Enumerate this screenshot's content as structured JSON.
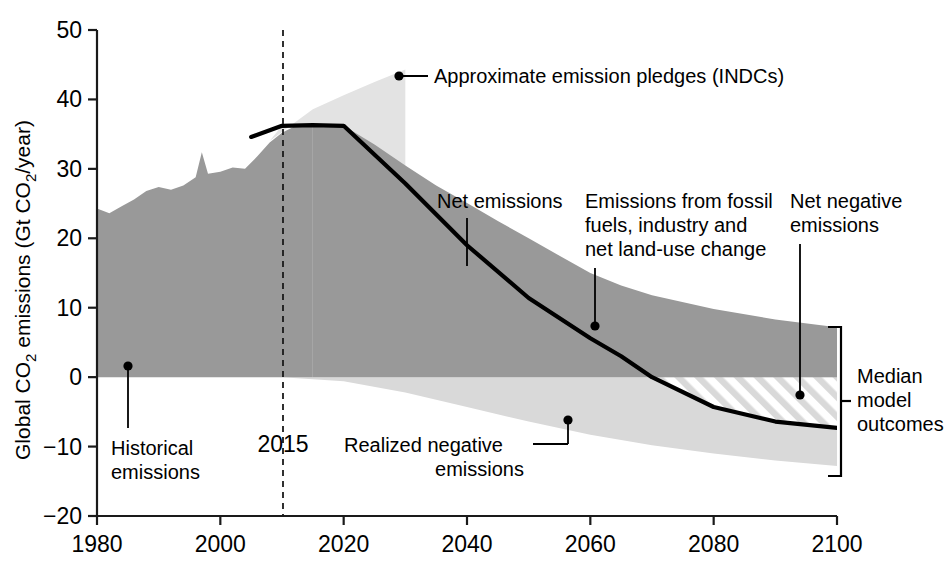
{
  "chart_data": {
    "type": "area",
    "title": "",
    "xlabel": "",
    "ylabel": "Global CO2 emissions (Gt CO2/year)",
    "ylabel_parts": {
      "pre": "Global CO",
      "sub1": "2",
      "mid": " emissions (Gt CO",
      "sub2": "2",
      "post": "/year)"
    },
    "xlim": [
      1980,
      2100
    ],
    "ylim": [
      -20,
      50
    ],
    "xticks": [
      1980,
      2000,
      2020,
      2040,
      2060,
      2080,
      2100
    ],
    "yticks": [
      50,
      40,
      30,
      20,
      10,
      0,
      -10,
      -20
    ],
    "grid": false,
    "legend": "none",
    "reference_line": {
      "label": "2015",
      "x": 2015,
      "style": "dashed"
    },
    "series": [
      {
        "name": "Historical emissions",
        "role": "historical-area",
        "color": "#999999",
        "x": [
          1980,
          1982,
          1984,
          1986,
          1988,
          1990,
          1992,
          1994,
          1996,
          1997,
          1998,
          2000,
          2002,
          2004,
          2006,
          2008,
          2010,
          2012,
          2015
        ],
        "values": [
          24.3,
          23.6,
          24.6,
          25.6,
          26.8,
          27.4,
          27.0,
          27.6,
          28.8,
          32.4,
          29.3,
          29.6,
          30.2,
          30.0,
          31.8,
          33.8,
          35.2,
          36.1,
          36.3
        ]
      },
      {
        "name": "Emissions from fossil fuels, industry and net land-use change",
        "role": "upper-band-area",
        "color": "#999999",
        "x": [
          2015,
          2020,
          2025,
          2030,
          2035,
          2040,
          2045,
          2050,
          2055,
          2060,
          2065,
          2070,
          2080,
          2090,
          2100
        ],
        "values": [
          36.3,
          36.2,
          33.5,
          30.5,
          27.6,
          25.1,
          22.5,
          20.0,
          17.5,
          15.0,
          13.2,
          11.8,
          9.8,
          8.3,
          7.2
        ]
      },
      {
        "name": "Realized negative emissions",
        "role": "lower-band-area",
        "color": "#d9d9d9",
        "x": [
          2010,
          2020,
          2030,
          2040,
          2050,
          2060,
          2070,
          2080,
          2090,
          2100
        ],
        "values": [
          0.0,
          -0.6,
          -2.2,
          -4.3,
          -6.4,
          -8.3,
          -9.8,
          -11.0,
          -12.0,
          -12.8
        ]
      },
      {
        "name": "Net emissions",
        "role": "net-line",
        "color": "#000000",
        "x": [
          2005,
          2010,
          2015,
          2020,
          2030,
          2040,
          2050,
          2060,
          2065,
          2070,
          2080,
          2090,
          2100
        ],
        "values": [
          34.6,
          36.2,
          36.3,
          36.2,
          27.9,
          19.0,
          11.4,
          5.6,
          3.0,
          0.0,
          -4.3,
          -6.4,
          -7.3
        ]
      },
      {
        "name": "Approximate emission pledges (INDCs)",
        "role": "indc-wedge",
        "color": "#e0e0e0",
        "x": [
          2008,
          2015,
          2020,
          2025,
          2030
        ],
        "values": [
          34.0,
          38.6,
          40.6,
          42.5,
          44.3
        ],
        "right_edge_year": 2030,
        "right_edge_bottom": 27.2
      },
      {
        "name": "Net negative emissions",
        "role": "hatched-region",
        "fill": "diagonal-hatch",
        "color": "#ffffff",
        "start_year": 2068,
        "end_year": 2100,
        "upper_value": 0.0
      }
    ],
    "annotations": [
      {
        "id": "indc",
        "label": "Approximate emission pledges (INDCs)",
        "point": [
          2029,
          43.4
        ]
      },
      {
        "id": "net",
        "label": "Net emissions",
        "point": [
          2042,
          19.1
        ]
      },
      {
        "id": "fossil",
        "label": "Emissions from fossil fuels, industry and net land-use change",
        "point": [
          2063,
          7.3
        ]
      },
      {
        "id": "netneg",
        "label": "Net negative emissions",
        "point": [
          2096,
          -2.6
        ]
      },
      {
        "id": "historical",
        "label": "Historical emissions",
        "point": [
          1985,
          1.7
        ]
      },
      {
        "id": "realizedneg",
        "label": "Realized negative emissions",
        "point": [
          2058,
          -6.6
        ]
      },
      {
        "id": "median",
        "label": "Median model outcomes",
        "bracket": [
          7.2,
          -12.8
        ]
      }
    ]
  },
  "annotation_text": {
    "indc": "Approximate emission pledges (INDCs)",
    "net": "Net emissions",
    "fossil_l1": "Emissions from fossil",
    "fossil_l2": "fuels, industry and",
    "fossil_l3": "net land-use change",
    "netneg_l1": "Net negative",
    "netneg_l2": "emissions",
    "historical_l1": "Historical",
    "historical_l2": "emissions",
    "realized_l1": "Realized negative",
    "realized_l2": "emissions",
    "median_l1": "Median",
    "median_l2": "model",
    "median_l3": "outcomes",
    "year_marker": "2015"
  },
  "axis": {
    "y_ticks": [
      "50",
      "40",
      "30",
      "20",
      "10",
      "0",
      "−10",
      "−20"
    ],
    "x_ticks": [
      "1980",
      "2000",
      "2020",
      "2040",
      "2060",
      "2080",
      "2100"
    ]
  },
  "colors": {
    "dark_band": "#999999",
    "light_band": "#d9d9d9",
    "indc_wedge": "#e3e3e3",
    "line": "#000000",
    "axis": "#1a1a1a"
  }
}
